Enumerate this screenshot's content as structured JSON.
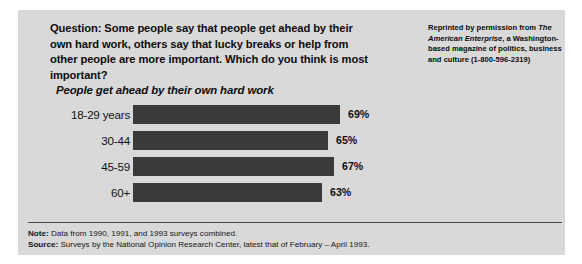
{
  "figure": {
    "question": "Question: Some people say that people get ahead by their own hard work, others say that lucky breaks or help from other people are more important. Which do you think is most important?",
    "subtitle": "People get ahead by their own hard work",
    "reprint": {
      "line1": "Reprinted by permission from",
      "magazine": "The American Enterprise",
      "line2": ", a",
      "line3": "Washington-based magazine",
      "line4": "of politics, business and",
      "line5": "culture (1-800-596-2319)"
    },
    "footnotes": [
      {
        "label": "Note:",
        "text": " Data from 1990, 1991, and 1993 surveys combined."
      },
      {
        "label": "Source:",
        "text": " Surveys by the National Opinion Research Center, latest that of February – April 1993."
      }
    ],
    "colors": {
      "panel": "#d9d9d9",
      "bar": "#3a3a3a",
      "text": "#0d0d0d"
    }
  },
  "chart_data": {
    "type": "bar",
    "orientation": "horizontal",
    "title": "People get ahead by their own hard work",
    "categories": [
      "18-29 years",
      "30-44",
      "45-59",
      "60+"
    ],
    "values": [
      69,
      65,
      67,
      63
    ],
    "value_labels": [
      "69%",
      "65%",
      "67%",
      "63%"
    ],
    "unit": "%",
    "xlabel": "",
    "ylabel": "",
    "xlim": [
      0,
      100
    ],
    "grid": false,
    "legend": false
  }
}
